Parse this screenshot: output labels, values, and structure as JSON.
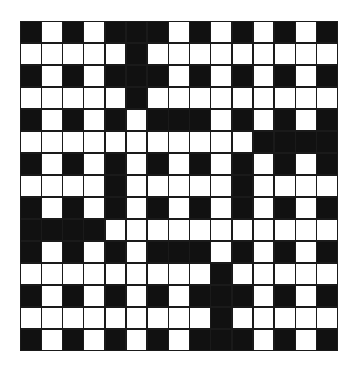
{
  "puzzle": {
    "type": "crossword-grid",
    "rows": 15,
    "cols": 15,
    "colors": {
      "block": "#111111",
      "open": "#ffffff",
      "border": "#1a1a1a"
    },
    "legend": "B = black block, W = white open square",
    "grid": [
      "BWBWBBBWBWBWBWB",
      "WWWWWBWWWWWWWWW",
      "BWBWBBBWBWBWBWB",
      "WWWWWBWWWWWWWWW",
      "BWBWBWBBBWBWBWB",
      "WWWWWWWWWWWBBBB",
      "BWBWBWBWBWBWBWB",
      "WWWWBWWWWWBWWWW",
      "BWBWBWBWBWBWBWB",
      "BBBBWWWWWWWWWWW",
      "BWBWBWBBBWBWBWB",
      "WWWWWWWWWBWWWWW",
      "BWBWBWBWBBBWBWB",
      "WWWWWWWWWBWWWWW",
      "BWBWBWBWBBBWBWB"
    ]
  }
}
